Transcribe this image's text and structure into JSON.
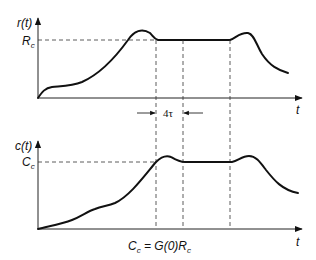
{
  "figure": {
    "top_plot": {
      "y_label": "r(t)",
      "x_label": "t",
      "level_label": "R",
      "level_sub": "c",
      "interval_label": "4τ"
    },
    "bottom_plot": {
      "y_label": "c(t)",
      "x_label": "t",
      "level_label": "C",
      "level_sub": "c",
      "equation": {
        "lhs": "C",
        "lhs_sub": "c",
        "mid": " = G(0)",
        "rhs": "R",
        "rhs_sub": "c"
      }
    },
    "colors": {
      "ink": "#111111",
      "background": "#ffffff"
    }
  }
}
